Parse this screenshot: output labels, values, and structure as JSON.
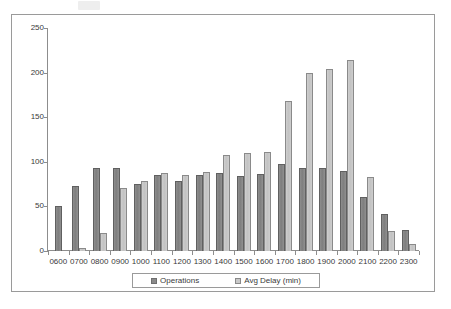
{
  "chart_data": {
    "type": "bar",
    "title": "",
    "subtitle": "",
    "xlabel": "",
    "ylabel": "",
    "ylim": [
      0,
      250
    ],
    "y_ticks": [
      0,
      50,
      100,
      150,
      200,
      250
    ],
    "grid": false,
    "legend_position": "bottom",
    "categories": [
      "0600",
      "0700",
      "0800",
      "0900",
      "1000",
      "1100",
      "1200",
      "1300",
      "1400",
      "1500",
      "1600",
      "1700",
      "1800",
      "1900",
      "2000",
      "2100",
      "2200",
      "2300"
    ],
    "series": [
      {
        "name": "Operations",
        "color": "#8a8a8a",
        "values": [
          50,
          73,
          93,
          93,
          75,
          85,
          78,
          85,
          88,
          84,
          86,
          98,
          93,
          93,
          90,
          61,
          42,
          23
        ]
      },
      {
        "name": "Avg Delay (min)",
        "color": "#c8c8c8",
        "values": [
          0,
          3,
          20,
          71,
          78,
          87,
          85,
          89,
          108,
          110,
          111,
          168,
          200,
          204,
          214,
          83,
          22,
          8
        ]
      }
    ]
  },
  "legend": {
    "entries": [
      {
        "label": "Operations",
        "swatch": "series-ops"
      },
      {
        "label": "Avg Delay (min)",
        "swatch": "series-delay"
      }
    ]
  }
}
